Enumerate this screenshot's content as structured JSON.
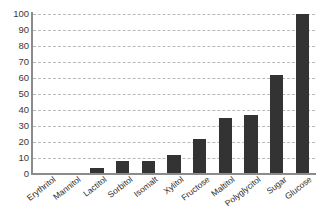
{
  "chart_data": {
    "type": "bar",
    "title": "",
    "subtitle": "",
    "xlabel": "",
    "ylabel": "",
    "ylim": [
      0,
      100
    ],
    "yticks": [
      100,
      90,
      80,
      70,
      60,
      50,
      40,
      30,
      20,
      10,
      0
    ],
    "grid": true,
    "legend": "none",
    "bar_color": "#333333",
    "grid_color": "#b9b9b9",
    "axis_color": "#8b8b8b",
    "categories": [
      "Erythritol",
      "Mannitol",
      "Lactitol",
      "Sorbitol",
      "Isomalt",
      "Xylitol",
      "Fructose",
      "Maltitol",
      "Polyglycitol",
      "Sugar",
      "Glucose"
    ],
    "values": [
      0,
      0,
      4,
      8,
      8,
      12,
      22,
      35,
      37,
      62,
      100
    ]
  }
}
